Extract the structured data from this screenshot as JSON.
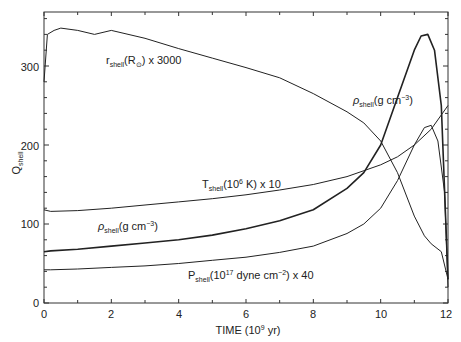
{
  "chart_data": {
    "type": "line",
    "title": "",
    "xlabel": "TIME (10^9 yr)",
    "ylabel": "Q_shell",
    "xlim": [
      0,
      12
    ],
    "ylim": [
      0,
      370
    ],
    "grid": false,
    "legend_position": "inline labels",
    "x_ticks": [
      0,
      2,
      4,
      6,
      8,
      10,
      12
    ],
    "y_ticks": [
      0,
      100,
      200,
      300
    ],
    "series": [
      {
        "name": "r_shell(R_sun) x 3000",
        "x": [
          0,
          0.1,
          0.3,
          0.5,
          1,
          1.5,
          2,
          3,
          4,
          5,
          6,
          7,
          8,
          9,
          9.5,
          10,
          10.5,
          11,
          11.3,
          11.5,
          11.8,
          12
        ],
        "values": [
          280,
          340,
          345,
          348,
          345,
          340,
          345,
          335,
          322,
          310,
          298,
          285,
          265,
          242,
          228,
          205,
          165,
          110,
          85,
          75,
          65,
          30
        ]
      },
      {
        "name": "T_shell(10^6 K) x 10",
        "x": [
          0,
          0.2,
          1,
          2,
          3,
          4,
          5,
          6,
          7,
          8,
          9,
          10,
          10.5,
          11,
          11.5,
          12
        ],
        "values": [
          118,
          116,
          117,
          120,
          124,
          128,
          132,
          137,
          143,
          150,
          160,
          175,
          185,
          200,
          220,
          250
        ]
      },
      {
        "name": "rho_shell(g cm^-3)",
        "x": [
          0,
          0.2,
          1,
          2,
          3,
          4,
          5,
          6,
          7,
          8,
          9,
          9.5,
          10,
          10.5,
          11,
          11.2,
          11.4,
          11.6,
          11.8,
          12
        ],
        "values": [
          65,
          66,
          68,
          72,
          76,
          80,
          86,
          94,
          104,
          118,
          145,
          165,
          200,
          260,
          320,
          338,
          340,
          320,
          250,
          30
        ]
      },
      {
        "name": "P_shell(10^17 dyne cm^-2) x 40",
        "x": [
          0,
          0.2,
          1,
          2,
          3,
          4,
          5,
          6,
          7,
          8,
          9,
          9.5,
          10,
          10.5,
          11,
          11.3,
          11.5,
          11.7,
          11.9,
          12
        ],
        "values": [
          42,
          42,
          43,
          45,
          47,
          50,
          54,
          58,
          64,
          72,
          88,
          100,
          120,
          155,
          200,
          222,
          225,
          205,
          140,
          20
        ]
      }
    ],
    "annotations": [
      {
        "text": "r_shell(R_sun) x 3000",
        "x": 2.0,
        "y": 324
      },
      {
        "text": "rho_shell(g cm^-3)",
        "x": 9.6,
        "y": 252
      },
      {
        "text": "T_shell(10^6 K) x 10",
        "x": 5.3,
        "y": 147
      },
      {
        "text": "rho_shell(g cm^-3)",
        "x": 2.4,
        "y": 93
      },
      {
        "text": "P_shell(10^17 dyne cm^-2) x 40",
        "x": 5.3,
        "y": 35
      }
    ]
  },
  "axes": {
    "x_title": "TIME",
    "x_title_unit_pre": "(10",
    "x_title_unit_exp": "9",
    "x_title_unit_post": " yr)",
    "y_title_main": "Q",
    "y_title_sub": "shell",
    "x_tick_labels": [
      "0",
      "2",
      "4",
      "6",
      "8",
      "10",
      "12"
    ],
    "y_tick_labels": [
      "0",
      "100",
      "200",
      "300"
    ]
  },
  "labels": {
    "r": {
      "main": "r",
      "sub": "shell",
      "rest": "(R",
      "sym": "⊙",
      "tail": ") x 3000"
    },
    "rho_top": {
      "main": "ρ",
      "sub": "shell",
      "rest": "(g cm",
      "exp": "−3",
      "tail": ")"
    },
    "T": {
      "main": "T",
      "sub": "shell",
      "rest": "(10",
      "exp": "6",
      "tail": " K) x 10"
    },
    "rho_mid": {
      "main": "ρ",
      "sub": "shell",
      "rest": "(g cm",
      "exp": "−3",
      "tail": ")"
    },
    "P": {
      "main": "P",
      "sub": "shell",
      "rest": "(10",
      "exp": "17",
      "tail": " dyne cm",
      "exp2": "−2",
      "tail2": ") x 40"
    }
  },
  "colors": {
    "line": "#222222",
    "axis": "#333333",
    "background": "#ffffff"
  }
}
